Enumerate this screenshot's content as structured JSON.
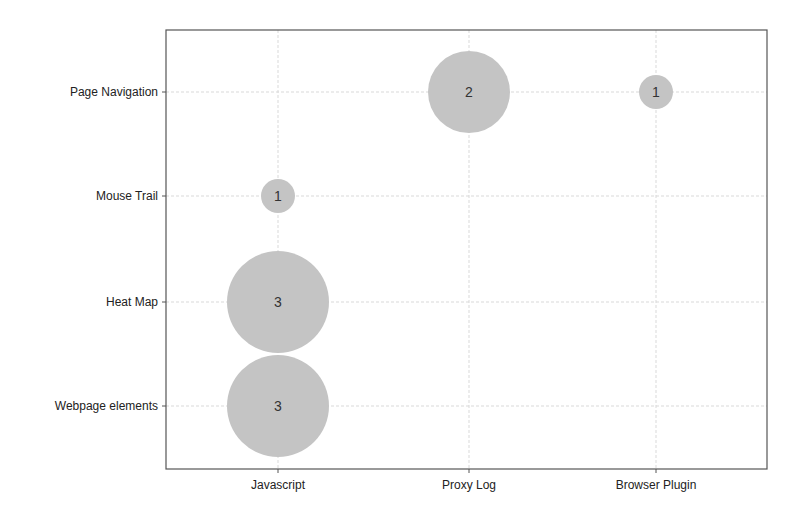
{
  "chart_data": {
    "type": "bubble",
    "title": "",
    "xlabel": "",
    "ylabel": "",
    "x_categories": [
      "Javascript",
      "Proxy Log",
      "Browser Plugin"
    ],
    "y_categories": [
      "Webpage elements",
      "Heat Map",
      "Mouse Trail",
      "Page Navigation"
    ],
    "points": [
      {
        "x": "Javascript",
        "y": "Webpage elements",
        "value": 3
      },
      {
        "x": "Javascript",
        "y": "Heat Map",
        "value": 3
      },
      {
        "x": "Javascript",
        "y": "Mouse Trail",
        "value": 1
      },
      {
        "x": "Proxy Log",
        "y": "Page Navigation",
        "value": 2
      },
      {
        "x": "Browser Plugin",
        "y": "Page Navigation",
        "value": 1
      }
    ],
    "grid": true,
    "legend": "none",
    "bubble_color": "#c4c4c4",
    "frame_color": "#555555",
    "grid_color": "#d9d9d9"
  },
  "layout": {
    "plot": {
      "left": 166,
      "top": 30,
      "right": 767,
      "bottom": 469
    },
    "x_positions": [
      278,
      469,
      656
    ],
    "y_positions": [
      406,
      302,
      196,
      92
    ],
    "radius_by_value": {
      "1": 17,
      "2": 41,
      "3": 51
    }
  }
}
